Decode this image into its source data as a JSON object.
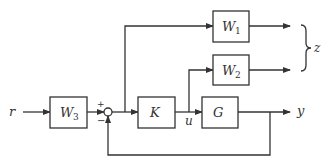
{
  "diagram": {
    "type": "block-diagram",
    "colors": {
      "stroke": "#333333",
      "background": "#ffffff"
    },
    "signals": {
      "r": "r",
      "u": "u",
      "y": "y",
      "z": "z"
    },
    "blocks": [
      {
        "id": "W3",
        "name": "W",
        "sub": "3"
      },
      {
        "id": "K",
        "name": "K",
        "sub": ""
      },
      {
        "id": "G",
        "name": "G",
        "sub": ""
      },
      {
        "id": "W1",
        "name": "W",
        "sub": "1"
      },
      {
        "id": "W2",
        "name": "W",
        "sub": "2"
      }
    ],
    "summing_junction": {
      "plus": "+",
      "minus": "−"
    },
    "connections": [
      "r → W3",
      "W3 → sum(+)",
      "sum → K",
      "sum output → W1",
      "K → u → G",
      "u → W2",
      "G → y",
      "y → sum(−) (feedback)",
      "W1, W2 → z"
    ]
  }
}
